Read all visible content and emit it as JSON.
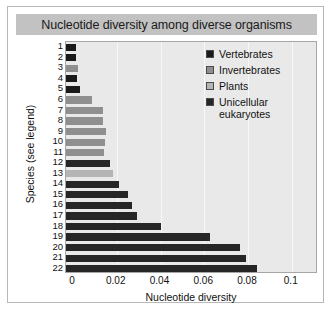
{
  "chart_data": {
    "type": "bar",
    "orientation": "horizontal",
    "title": "Nucleotide diversity among diverse organisms",
    "xlabel": "Nucleotide diversity",
    "ylabel": "Species (see legend)",
    "xlim": [
      0,
      0.112
    ],
    "xticks": [
      0,
      0.02,
      0.04,
      0.06,
      0.08,
      0.1
    ],
    "xticklabels": [
      "0",
      "0.02",
      "0.04",
      "0.06",
      "0.08",
      "0.1"
    ],
    "grid": "vertical",
    "legend_position": "upper right",
    "categories": [
      "1",
      "2",
      "3",
      "4",
      "5",
      "6",
      "7",
      "8",
      "9",
      "10",
      "11",
      "12",
      "13",
      "14",
      "15",
      "16",
      "17",
      "18",
      "19",
      "20",
      "21",
      "22"
    ],
    "values": [
      0.0013,
      0.0013,
      0.0021,
      0.0017,
      0.003,
      0.0087,
      0.0139,
      0.0139,
      0.0152,
      0.0148,
      0.0143,
      0.0169,
      0.0182,
      0.0212,
      0.0252,
      0.0269,
      0.0291,
      0.0403,
      0.0628,
      0.0762,
      0.0789,
      0.0841
    ],
    "group_of_bar": [
      "Vertebrates",
      "Vertebrates",
      "Invertebrates",
      "Vertebrates",
      "Vertebrates",
      "Invertebrates",
      "Invertebrates",
      "Invertebrates",
      "Invertebrates",
      "Invertebrates",
      "Invertebrates",
      "Unicellular eukaryotes",
      "Plants",
      "Unicellular eukaryotes",
      "Unicellular eukaryotes",
      "Unicellular eukaryotes",
      "Unicellular eukaryotes",
      "Unicellular eukaryotes",
      "Unicellular eukaryotes",
      "Unicellular eukaryotes",
      "Unicellular eukaryotes",
      "Unicellular eukaryotes"
    ],
    "legend": [
      {
        "label": "Vertebrates",
        "color": "#1a1a1a"
      },
      {
        "label": "Invertebrates",
        "color": "#8f8f8f"
      },
      {
        "label": "Plants",
        "color": "#b5b5b5"
      },
      {
        "label": "Unicellular eukaryotes",
        "label_line1": "Unicellular",
        "label_line2": "eukaryotes",
        "color": "#262626"
      }
    ]
  },
  "colors": {
    "title_bar": "#c2c2c2",
    "plot_background": "#e9e9e9",
    "gridline": "#f7f7f7",
    "frame_border": "#a6a6a6",
    "figure_border": "#b8b8b8",
    "text": "#111111"
  }
}
